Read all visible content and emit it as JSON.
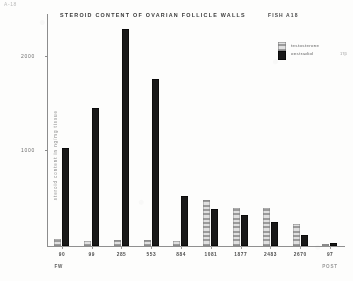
{
  "figure": {
    "corner_mark": "A-18",
    "title": "STEROID  CONTENT  OF  OVARIAN  FOLLICLE  WALLS",
    "title_suffix": "FISH  A18"
  },
  "legend": {
    "position": "top-right",
    "items": [
      {
        "key": "testosterone",
        "label": "testosterone",
        "swatch": "solid-black",
        "color": "#1b1b1b"
      },
      {
        "key": "oestradiol",
        "label": "oestradiol",
        "swatch": "light-stipple",
        "color": "#cacaca"
      }
    ],
    "note": "17β"
  },
  "axes": {
    "y": {
      "title": "steroid content  in  ng/mg  tissue",
      "ticks": [
        {
          "value": 1000,
          "label": "1000"
        },
        {
          "value": 2000,
          "label": "2000"
        }
      ],
      "min": 0,
      "max": 2450
    },
    "x": {
      "title": "FW",
      "sub_note": "POST",
      "categories": [
        "90",
        "99",
        "285",
        "553",
        "884",
        "1081",
        "1877",
        "2483",
        "2670",
        "97"
      ]
    }
  },
  "chart_data": {
    "type": "bar",
    "title": "STEROID CONTENT OF OVARIAN FOLLICLE WALLS  FISH A18",
    "xlabel": "FW",
    "ylabel": "steroid content in ng/mg tissue",
    "ylim": [
      0,
      2450
    ],
    "grid": false,
    "legend_position": "top-right",
    "categories": [
      "90",
      "99",
      "285",
      "553",
      "884",
      "1081",
      "1877",
      "2483",
      "2670",
      "97"
    ],
    "series": [
      {
        "name": "testosterone",
        "color": "#1b1b1b",
        "values": [
          1030,
          1460,
          2290,
          1760,
          530,
          390,
          330,
          250,
          120,
          30
        ]
      },
      {
        "name": "oestradiol",
        "color": "#cacaca",
        "values": [
          70,
          50,
          60,
          60,
          55,
          490,
          400,
          400,
          230,
          25
        ]
      }
    ]
  }
}
